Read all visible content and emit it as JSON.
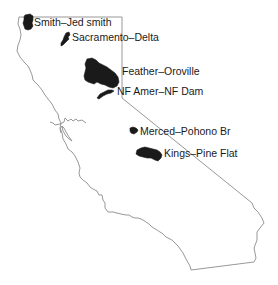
{
  "map": {
    "region": "California",
    "basins": [
      {
        "id": "smith",
        "label": "Smith–Jed smith"
      },
      {
        "id": "sacramento",
        "label": "Sacramento–Delta"
      },
      {
        "id": "feather",
        "label": "Feather–Oroville"
      },
      {
        "id": "nfamer",
        "label": "NF Amer–NF Dam"
      },
      {
        "id": "merced",
        "label": "Merced–Pohono Br"
      },
      {
        "id": "kings",
        "label": "Kings–Pine Flat"
      }
    ],
    "colors": {
      "basin_fill": "#1a1a1a",
      "state_outline": "#8c8c8c",
      "label_text": "#1a1a1a",
      "background": "#ffffff"
    }
  }
}
